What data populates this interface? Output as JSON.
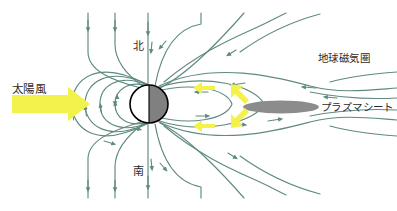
{
  "figure": {
    "width": 397,
    "height": 211,
    "background": "#ffffff"
  },
  "colors": {
    "field_line": "#5f8a80",
    "field_line_alt": "#6d9089",
    "solar_wind_arrow": "#f2f24d",
    "reconnection_arrow": "#f4f24a",
    "earth_day_side": "#ffffff",
    "earth_night_side": "#808080",
    "earth_outline": "#000000",
    "plasma_sheet": "#8c8c8c",
    "text": "#2b2b2b"
  },
  "labels": {
    "solar_wind": "太陽風",
    "north": "北",
    "south": "南",
    "magnetosphere": "地球磁気圏",
    "plasma_sheet": "プラズマシート"
  },
  "elements": {
    "earth": {
      "name": "earth-sphere",
      "center_x": 149,
      "center_y": 104,
      "radius": 19,
      "day_side": "left",
      "night_side": "right"
    },
    "plasma_sheet_ellipse": {
      "name": "plasma-sheet-ellipse",
      "center_x": 281,
      "center_y": 107,
      "rx": 38,
      "ry": 6.5
    },
    "solar_wind_arrow": {
      "name": "solar-wind-arrow",
      "direction": "right",
      "x": 12,
      "y": 94,
      "length": 78,
      "color": "#f2f24d"
    },
    "reconnection_arrows": [
      {
        "name": "reconnection-arrow-upper-left",
        "direction": "left",
        "x": 193,
        "y": 88
      },
      {
        "name": "reconnection-arrow-lower-left",
        "direction": "left",
        "x": 193,
        "y": 126
      },
      {
        "name": "reconnection-arrow-upper-right",
        "direction": "up-right",
        "x": 237,
        "y": 90
      },
      {
        "name": "reconnection-arrow-lower-right",
        "direction": "down-right",
        "x": 237,
        "y": 122
      }
    ]
  },
  "field_lines": {
    "closed_dayside_count": 4,
    "open_polar_north_count": 5,
    "open_polar_south_count": 5,
    "tail_lines_count": 6,
    "arrow_direction_dayside": "toward-earth",
    "arrow_direction_tail_north": "toward-earth",
    "arrow_direction_tail_south": "away-from-earth"
  }
}
